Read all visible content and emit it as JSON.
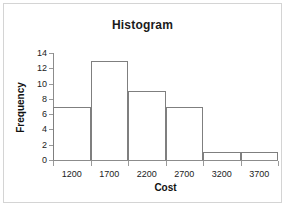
{
  "chart_data": {
    "type": "bar",
    "title": "Histogram",
    "xlabel": "Cost",
    "ylabel": "Frequency",
    "categories": [
      "1200",
      "1700",
      "2200",
      "2700",
      "3200",
      "3700"
    ],
    "values": [
      7,
      13,
      9,
      7,
      1,
      1
    ],
    "x_tick_labels": [
      "1200",
      "1700",
      "2200",
      "2700",
      "3200",
      "3700"
    ],
    "y_tick_labels": [
      "0",
      "2",
      "4",
      "6",
      "8",
      "10",
      "12",
      "14"
    ],
    "y_tick_values": [
      0,
      2,
      4,
      6,
      8,
      10,
      12,
      14
    ],
    "ylim": [
      0,
      14
    ],
    "grid": false,
    "legend": false,
    "bar_fill_color": "#ffffff",
    "bar_border_color": "#7f7f7f",
    "axis_color": "#8c8c8c",
    "frame_border_color": "#d4d4d4",
    "background_color": "#ffffff",
    "text_color": "#222222"
  }
}
